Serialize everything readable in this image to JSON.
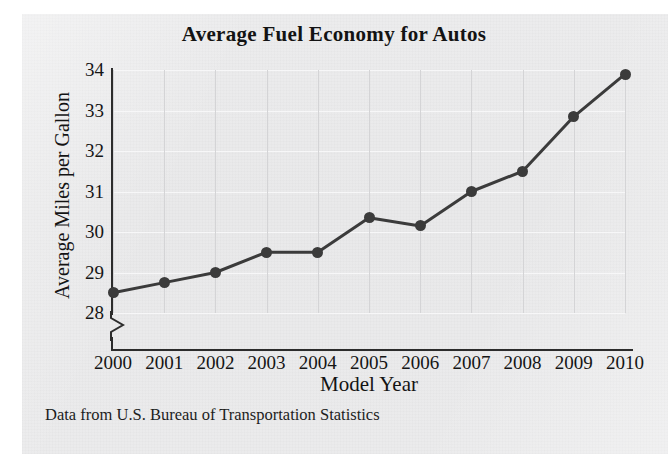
{
  "chart_data": {
    "type": "line",
    "title": "Average Fuel Economy for Autos",
    "xlabel": "Model Year",
    "ylabel": "Average Miles per Gallon",
    "categories": [
      "2000",
      "2001",
      "2002",
      "2003",
      "2004",
      "2005",
      "2006",
      "2007",
      "2008",
      "2009",
      "2010"
    ],
    "values": [
      28.5,
      28.75,
      29.0,
      29.5,
      29.5,
      30.35,
      30.15,
      31.0,
      31.5,
      32.85,
      33.9
    ],
    "series": [
      {
        "name": "Average Miles per Gallon",
        "values": [
          28.5,
          28.75,
          29.0,
          29.5,
          29.5,
          30.35,
          30.15,
          31.0,
          31.5,
          32.85,
          33.9
        ]
      }
    ],
    "ylim": [
      28,
      34
    ],
    "xlim": [
      "2000",
      "2010"
    ],
    "ytick_labels": [
      "28",
      "29",
      "30",
      "31",
      "32",
      "33",
      "34"
    ],
    "ytick_values": [
      28,
      29,
      30,
      31,
      32,
      33,
      34
    ],
    "xtick_labels": [
      "2000",
      "2001",
      "2002",
      "2003",
      "2004",
      "2005",
      "2006",
      "2007",
      "2008",
      "2009",
      "2010"
    ],
    "grid": true,
    "grid_axes": "both",
    "legend": "none",
    "y_axis_break": true,
    "marker": "filled-circle",
    "line_color": "#3b3b3b",
    "marker_color": "#3b3b3b",
    "axis_color": "#2c2c2c",
    "grid_color_horizontal": "#f7f7f8",
    "grid_color_vertical": "#d4d4d6",
    "background_color": "#eaeaeb",
    "annotations": [
      "Data from U.S. Bureau of Transportation Statistics"
    ]
  },
  "footer": {
    "source_note": "Data from U.S. Bureau of Transportation Statistics"
  }
}
